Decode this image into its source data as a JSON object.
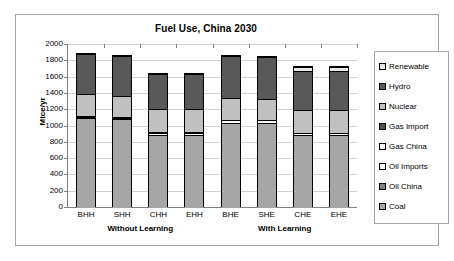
{
  "chart_data": {
    "type": "bar",
    "subtype": "stacked-bar",
    "title": "Fuel Use, China 2030",
    "xlabel": "",
    "ylabel": "Mtce/yr",
    "ylim": [
      0,
      2000
    ],
    "ytick_step": 200,
    "ytick_labels": [
      "2000",
      "1800",
      "1600",
      "1400",
      "1200",
      "1000",
      "800",
      "600",
      "400",
      "200",
      "0"
    ],
    "grid": true,
    "legend_position": "right",
    "categories": [
      "BHH",
      "SHH",
      "CHH",
      "EHH",
      "BHE",
      "SHE",
      "CHE",
      "EHE"
    ],
    "group_labels": [
      {
        "label": "Without Learning",
        "categories": [
          "BHH",
          "SHH",
          "CHH",
          "EHH"
        ]
      },
      {
        "label": "With Learning",
        "categories": [
          "BHE",
          "SHE",
          "CHE",
          "EHE"
        ]
      }
    ],
    "series": [
      {
        "name": "Coal",
        "color": "#a6a6a6",
        "values": [
          1090,
          1080,
          890,
          890,
          1030,
          1030,
          880,
          880
        ]
      },
      {
        "name": "Oil China",
        "color": "#808080",
        "values": [
          10,
          10,
          10,
          10,
          10,
          10,
          10,
          10
        ]
      },
      {
        "name": "Oil Imports",
        "color": "#ffffff",
        "values": [
          20,
          20,
          20,
          20,
          35,
          35,
          25,
          25
        ]
      },
      {
        "name": "Gas China",
        "color": "#fafafa",
        "values": [
          5,
          5,
          5,
          5,
          5,
          5,
          5,
          5
        ]
      },
      {
        "name": "Gas Import",
        "color": "#4d4d4d",
        "values": [
          5,
          5,
          5,
          5,
          5,
          5,
          5,
          5
        ]
      },
      {
        "name": "Nuclear",
        "color": "#c0c0c0",
        "values": [
          270,
          260,
          280,
          280,
          260,
          255,
          280,
          280
        ]
      },
      {
        "name": "Hydro",
        "color": "#595959",
        "values": [
          490,
          480,
          440,
          440,
          515,
          515,
          470,
          470
        ]
      },
      {
        "name": "Renewable",
        "color": "#e8e8e8",
        "values": [
          0,
          0,
          0,
          0,
          0,
          0,
          55,
          55
        ]
      }
    ],
    "totals": [
      1890,
      1860,
      1650,
      1650,
      1860,
      1855,
      1735,
      1725
    ],
    "legend_entries": [
      {
        "label": "Renewable",
        "color": "#e8e8e8"
      },
      {
        "label": "Hydro",
        "color": "#595959"
      },
      {
        "label": "Nuclear",
        "color": "#c0c0c0"
      },
      {
        "label": "Gas Import",
        "color": "#4d4d4d"
      },
      {
        "label": "Gas China",
        "color": "#fafafa"
      },
      {
        "label": "Oil Imports",
        "color": "#ffffff"
      },
      {
        "label": "Oil China",
        "color": "#808080"
      },
      {
        "label": "Coal",
        "color": "#a6a6a6"
      }
    ]
  }
}
